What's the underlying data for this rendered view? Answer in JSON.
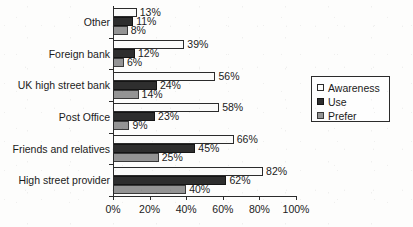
{
  "chart_data": {
    "type": "bar",
    "orientation": "horizontal",
    "title": "",
    "subtitle": "",
    "xlabel": "",
    "ylabel": "",
    "xlim": [
      0,
      100
    ],
    "xticks": [
      "0%",
      "20%",
      "40%",
      "60%",
      "80%",
      "100%"
    ],
    "xtick_values": [
      0,
      20,
      40,
      60,
      80,
      100
    ],
    "grid": false,
    "legend_position": "right",
    "value_suffix": "%",
    "categories": [
      "Other",
      "Foreign bank",
      "UK high street bank",
      "Post Office",
      "Friends and relatives",
      "High street provider"
    ],
    "series": [
      {
        "name": "Awareness",
        "color": "#fbfbfa",
        "values": [
          13,
          39,
          56,
          58,
          66,
          82
        ],
        "labels": [
          "13%",
          "39%",
          "56%",
          "58%",
          "66%",
          "82%"
        ]
      },
      {
        "name": "Use",
        "color": "#2e2e2e",
        "values": [
          11,
          12,
          24,
          23,
          45,
          62
        ],
        "labels": [
          "11%",
          "12%",
          "24%",
          "23%",
          "45%",
          "62%"
        ]
      },
      {
        "name": "Prefer",
        "color": "#949494",
        "values": [
          8,
          6,
          14,
          9,
          25,
          40
        ],
        "labels": [
          "8%",
          "6%",
          "14%",
          "9%",
          "25%",
          "40%"
        ]
      }
    ]
  },
  "legend": {
    "items": [
      {
        "label": "Awareness",
        "swatch": "s-awareness"
      },
      {
        "label": "Use",
        "swatch": "s-use"
      },
      {
        "label": "Prefer",
        "swatch": "s-prefer"
      }
    ]
  }
}
